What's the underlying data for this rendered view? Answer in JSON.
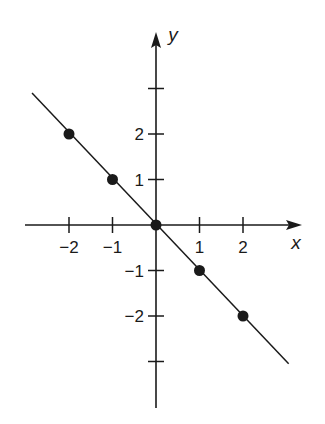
{
  "chart_data": {
    "type": "line",
    "title": "",
    "xlabel": "x",
    "ylabel": "y",
    "xlim": [
      -3,
      3
    ],
    "ylim": [
      -4,
      4
    ],
    "grid": false,
    "x_ticks": [
      -2,
      -1,
      1,
      2
    ],
    "x_tick_labels": [
      "−2",
      "−1",
      "1",
      "2"
    ],
    "y_ticks": [
      3,
      2,
      1,
      -1,
      -2,
      -3
    ],
    "y_tick_labels": [
      "",
      "2",
      "1",
      "−1",
      "−2",
      ""
    ],
    "series": [
      {
        "name": "y = -x",
        "line": {
          "x": [
            -2.85,
            3.05
          ],
          "y": [
            2.9,
            -3.05
          ]
        },
        "points": [
          {
            "x": -2,
            "y": 2
          },
          {
            "x": -1,
            "y": 1
          },
          {
            "x": 0,
            "y": 0
          },
          {
            "x": 1,
            "y": -1
          },
          {
            "x": 2,
            "y": -2
          }
        ]
      }
    ]
  },
  "colors": {
    "ink": "#1a1a1a",
    "background": "#ffffff"
  }
}
